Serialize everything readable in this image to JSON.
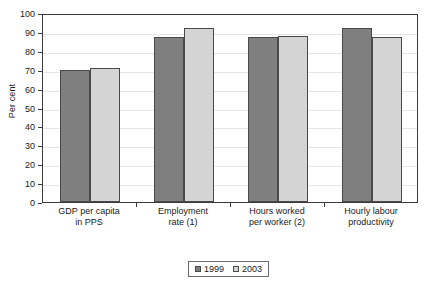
{
  "chart_data": {
    "type": "bar",
    "title": "",
    "xlabel": "",
    "ylabel": "Per cent",
    "ylim": [
      0,
      100
    ],
    "ytick_step": 10,
    "ytick_labels": [
      "0",
      "10",
      "20",
      "30",
      "40",
      "50",
      "60",
      "70",
      "80",
      "90",
      "100"
    ],
    "grid": true,
    "legend_position": "bottom-center",
    "categories": [
      "GDP per capita\nin PPS",
      "Employment\nrate (1)",
      "Hours worked\nper worker (2)",
      "Hourly labour\nproductivity"
    ],
    "series": [
      {
        "name": "1999",
        "color": "#7f7f7f",
        "values": [
          70,
          87.5,
          87.5,
          92
        ]
      },
      {
        "name": "2003",
        "color": "#d4d4d4",
        "values": [
          71,
          92,
          88,
          87.5
        ]
      }
    ]
  },
  "colors": {
    "series_1999": "#7f7f7f",
    "series_2003": "#d4d4d4",
    "axis": "#3b3b3b",
    "gridline": "#e6e6e6",
    "background": "#ffffff"
  }
}
